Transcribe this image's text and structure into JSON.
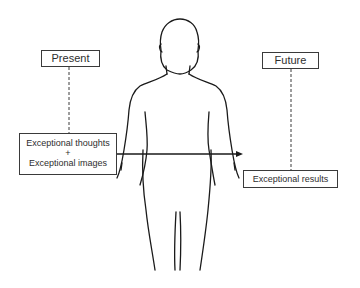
{
  "diagram": {
    "present_label": "Present",
    "future_label": "Future",
    "present_content": {
      "line1": "Exceptional thoughts",
      "plus": "+",
      "line2": "Exceptional images"
    },
    "future_content": "Exceptional results",
    "colors": {
      "line": "#1a1a1a",
      "box_border": "#3a3a3a",
      "text": "#2e2e2e"
    },
    "figure": "human-body-outline-icon"
  }
}
